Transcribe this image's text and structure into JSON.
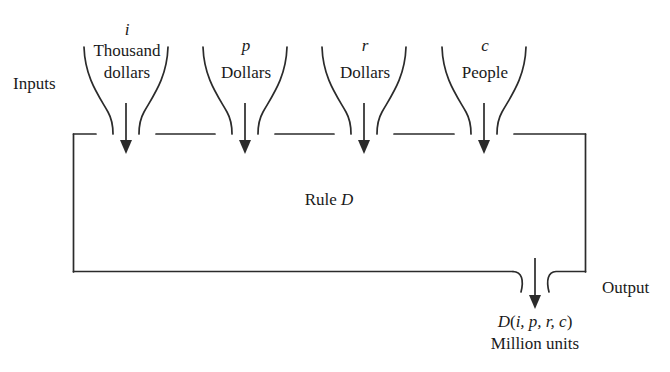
{
  "figure": {
    "stroke_color": "#2b2b2b",
    "background_color": "#ffffff",
    "text_color": "#1a1a1a"
  },
  "inputs_label": "Inputs",
  "output_label": "Output",
  "rule": {
    "prefix": "Rule ",
    "symbol": "D"
  },
  "funnels": [
    {
      "variable": "i",
      "unit_line1": "Thousand",
      "unit_line2": "dollars"
    },
    {
      "variable": "p",
      "unit_line1": "Dollars",
      "unit_line2": ""
    },
    {
      "variable": "r",
      "unit_line1": "Dollars",
      "unit_line2": ""
    },
    {
      "variable": "c",
      "unit_line1": "People",
      "unit_line2": ""
    }
  ],
  "output": {
    "expression_name": "D",
    "expression_open": "(",
    "expression_args": "i, p, r, c",
    "expression_close": ")",
    "units": "Million units"
  }
}
